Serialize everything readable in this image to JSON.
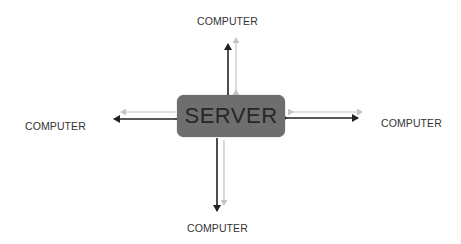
{
  "diagram": {
    "type": "client-server topology",
    "server": {
      "label": "SERVER",
      "fill": "#6e6e6e",
      "text_color": "#262626"
    },
    "nodes": [
      {
        "id": "top",
        "label": "COMPUTER"
      },
      {
        "id": "left",
        "label": "COMPUTER"
      },
      {
        "id": "right",
        "label": "COMPUTER"
      },
      {
        "id": "bottom",
        "label": "COMPUTER"
      }
    ],
    "connections": [
      {
        "from": "server",
        "to": "top",
        "style": "bidirectional",
        "color": "#222222"
      },
      {
        "from": "server",
        "to": "top",
        "style": "bidirectional",
        "color": "#c4c4c4"
      },
      {
        "from": "server",
        "to": "left",
        "style": "bidirectional",
        "color": "#222222"
      },
      {
        "from": "server",
        "to": "left",
        "style": "one-way-to-computer",
        "color": "#c4c4c4"
      },
      {
        "from": "server",
        "to": "right",
        "style": "bidirectional",
        "color": "#222222"
      },
      {
        "from": "server",
        "to": "right",
        "style": "bidirectional",
        "color": "#c4c4c4"
      },
      {
        "from": "server",
        "to": "bottom",
        "style": "one-way-to-computer",
        "color": "#222222"
      },
      {
        "from": "server",
        "to": "bottom",
        "style": "one-way-to-computer",
        "color": "#c4c4c4"
      }
    ],
    "colors": {
      "dark_arrow": "#222222",
      "light_arrow": "#c4c4c4",
      "label_text": "#333333"
    }
  }
}
